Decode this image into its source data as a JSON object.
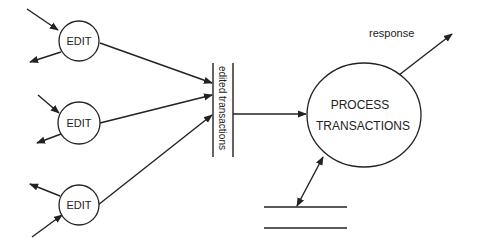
{
  "diagram": {
    "type": "data-flow-diagram",
    "colors": {
      "stroke": "#222222",
      "background": "#ffffff"
    },
    "processes": [
      {
        "id": "edit1",
        "label": "EDIT",
        "cx": 79,
        "cy": 41,
        "r": 20
      },
      {
        "id": "edit2",
        "label": "EDIT",
        "cx": 79,
        "cy": 123,
        "r": 21
      },
      {
        "id": "edit3",
        "label": "EDIT",
        "cx": 79,
        "cy": 205,
        "r": 20
      },
      {
        "id": "process",
        "label_line1": "PROCESS",
        "label_line2": "TRANSACTIONS",
        "cx": 364,
        "cy": 115,
        "rx": 57,
        "ry": 52
      }
    ],
    "data_stores": [
      {
        "id": "edited-transactions",
        "label": "edited transactions",
        "orientation": "vertical"
      },
      {
        "id": "bottom-store",
        "label": "",
        "orientation": "horizontal"
      }
    ],
    "flows": [
      {
        "from": "external",
        "to": "edit1",
        "label": ""
      },
      {
        "from": "edit1",
        "to": "external",
        "label": ""
      },
      {
        "from": "external",
        "to": "edit2",
        "label": ""
      },
      {
        "from": "edit2",
        "to": "external",
        "label": ""
      },
      {
        "from": "external",
        "to": "edit3",
        "label": ""
      },
      {
        "from": "edit3",
        "to": "external",
        "label": ""
      },
      {
        "from": "edit1",
        "to": "edited-transactions",
        "label": ""
      },
      {
        "from": "edit2",
        "to": "edited-transactions",
        "label": ""
      },
      {
        "from": "edit3",
        "to": "edited-transactions",
        "label": ""
      },
      {
        "from": "edited-transactions",
        "to": "process",
        "label": ""
      },
      {
        "from": "process",
        "to": "external",
        "label": "response"
      },
      {
        "from": "process",
        "to": "bottom-store",
        "label": "",
        "bidirectional": true
      }
    ]
  }
}
